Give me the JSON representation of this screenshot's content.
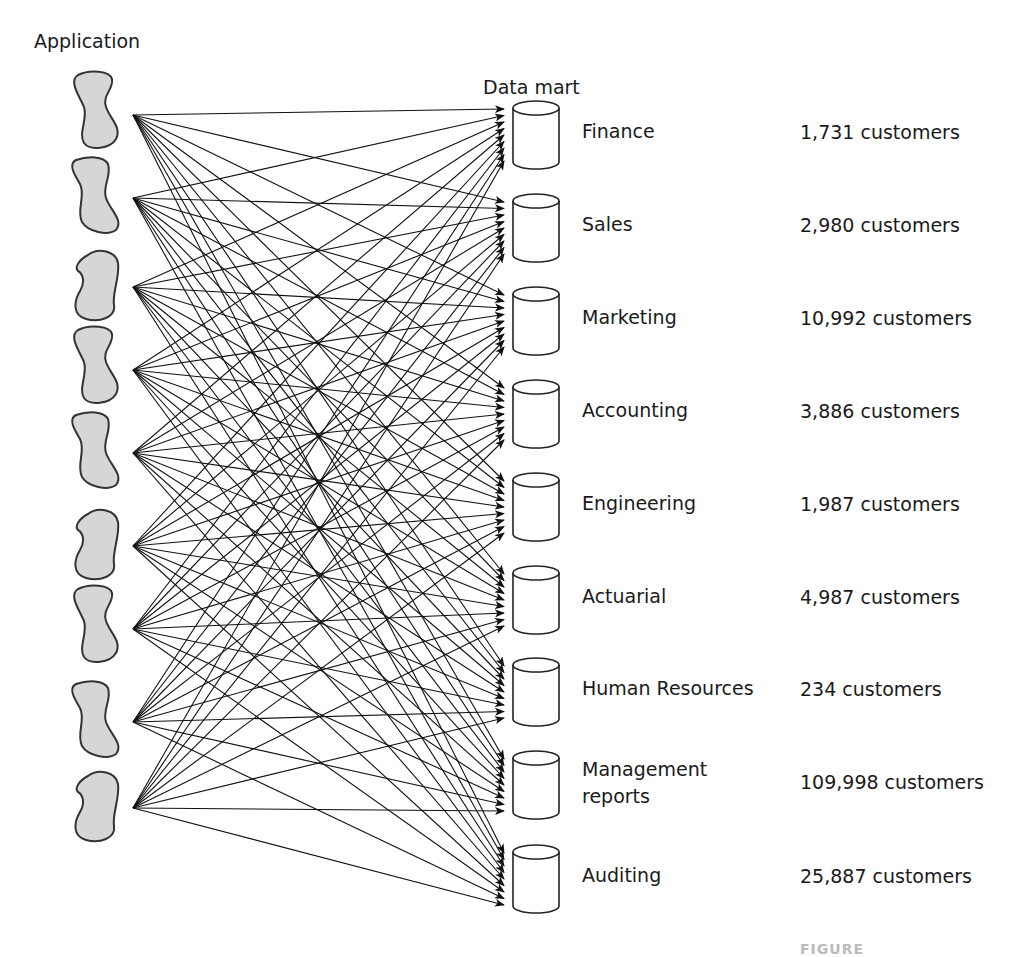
{
  "headers": {
    "application": "Application",
    "data_mart": "Data mart"
  },
  "applications": [
    {
      "id": 1,
      "y": 115
    },
    {
      "id": 2,
      "y": 198
    },
    {
      "id": 3,
      "y": 287
    },
    {
      "id": 4,
      "y": 370
    },
    {
      "id": 5,
      "y": 453
    },
    {
      "id": 6,
      "y": 546
    },
    {
      "id": 7,
      "y": 629
    },
    {
      "id": 8,
      "y": 722
    },
    {
      "id": 9,
      "y": 808
    }
  ],
  "data_marts": [
    {
      "name": "Finance",
      "customers": "1,731 customers",
      "top": 101
    },
    {
      "name": "Sales",
      "customers": "2,980 customers",
      "top": 194
    },
    {
      "name": "Marketing",
      "customers": "10,992 customers",
      "top": 287
    },
    {
      "name": "Accounting",
      "customers": "3,886 customers",
      "top": 380
    },
    {
      "name": "Engineering",
      "customers": "1,987 customers",
      "top": 473
    },
    {
      "name": "Actuarial",
      "customers": "4,987 customers",
      "top": 566
    },
    {
      "name": "Human Resources",
      "customers": "234 customers",
      "top": 658
    },
    {
      "name": "Management\nreports",
      "customers": "109,998 customers",
      "top": 751
    },
    {
      "name": "Auditing",
      "customers": "25,887 customers",
      "top": 845
    }
  ],
  "caption": "FIGURE"
}
